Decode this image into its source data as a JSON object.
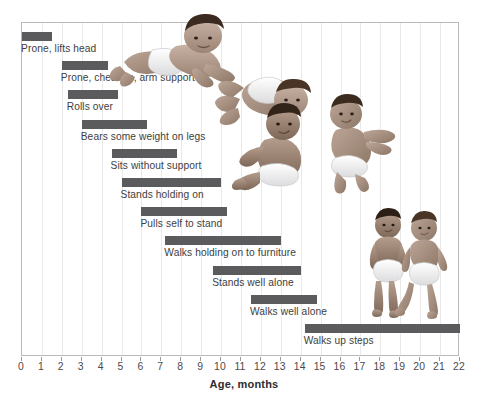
{
  "chart_data": {
    "type": "bar",
    "orientation": "horizontal-range",
    "title": "",
    "xlabel": "Age, months",
    "ylabel": "",
    "xlim": [
      0,
      22
    ],
    "xticks": [
      0,
      1,
      2,
      3,
      4,
      5,
      6,
      7,
      8,
      9,
      10,
      11,
      12,
      13,
      14,
      15,
      16,
      17,
      18,
      19,
      20,
      21,
      22
    ],
    "xtick_labels": [
      "0",
      "1",
      "2",
      "3",
      "4",
      "5",
      "6",
      "7",
      "8",
      "9",
      "10",
      "11",
      "12",
      "13",
      "14",
      "15",
      "16",
      "17",
      "18",
      "19",
      "20",
      "21",
      "22"
    ],
    "grid": true,
    "grid_axis": "x",
    "legend": false,
    "bar_color": "#5b5b5d",
    "grid_color": "#e9e9ea",
    "frame_color": "#b9b9bb",
    "categories": [
      "Prone, lifts head",
      "Prone, chest up, arm support",
      "Rolls over",
      "Bears some weight on legs",
      "Sits without support",
      "Stands holding on",
      "Pulls self to stand",
      "Walks holding on to furniture",
      "Stands well alone",
      "Walks well alone",
      "Walks up steps"
    ],
    "ranges": [
      {
        "label": "Prone, lifts head",
        "start": 0.0,
        "end": 1.5
      },
      {
        "label": "Prone, chest up, arm support",
        "start": 2.0,
        "end": 4.3
      },
      {
        "label": "Rolls over",
        "start": 2.3,
        "end": 4.8
      },
      {
        "label": "Bears some weight on legs",
        "start": 3.0,
        "end": 6.3
      },
      {
        "label": "Sits without support",
        "start": 4.5,
        "end": 7.8
      },
      {
        "label": "Stands holding on",
        "start": 5.0,
        "end": 10.0
      },
      {
        "label": "Pulls self to stand",
        "start": 6.0,
        "end": 10.3
      },
      {
        "label": "Walks holding on to furniture",
        "start": 7.2,
        "end": 13.0
      },
      {
        "label": "Stands well alone",
        "start": 9.6,
        "end": 14.0
      },
      {
        "label": "Walks well alone",
        "start": 11.5,
        "end": 14.8
      },
      {
        "label": "Walks up steps",
        "start": 14.2,
        "end": 22.0
      }
    ]
  },
  "illustrations": [
    {
      "name": "prone-lifting-head-baby",
      "alt": "Infant lying prone, lifting head and chest on arms"
    },
    {
      "name": "rolling-over-baby",
      "alt": "Infant rolling over on back"
    },
    {
      "name": "sitting-baby",
      "alt": "Infant sitting without support"
    },
    {
      "name": "crawling-reaching-baby",
      "alt": "Infant propped up reaching forward"
    },
    {
      "name": "standing-toddler",
      "alt": "Toddler standing well alone"
    },
    {
      "name": "walking-toddler",
      "alt": "Toddler walking well alone"
    }
  ]
}
